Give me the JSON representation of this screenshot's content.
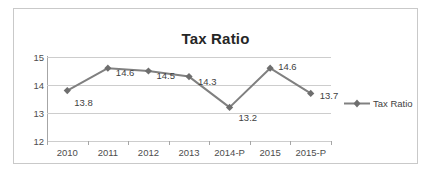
{
  "frame": {
    "border_color": "#c9c9c9",
    "background": "#ffffff"
  },
  "chart_data": {
    "type": "line",
    "title": "Tax Ratio",
    "xlabel": "",
    "ylabel": "",
    "categories": [
      "2010",
      "2011",
      "2012",
      "2013",
      "2014-P",
      "2015",
      "2015-P"
    ],
    "values": [
      13.8,
      14.6,
      14.5,
      14.3,
      13.2,
      14.6,
      13.7
    ],
    "data_labels": [
      "13.8",
      "14.6",
      "14.5",
      "14.3",
      "13.2",
      "14.6",
      "13.7"
    ],
    "series": [
      {
        "name": "Tax Ratio",
        "values": [
          13.8,
          14.6,
          14.5,
          14.3,
          13.2,
          14.6,
          13.7
        ]
      }
    ],
    "ylim": [
      12,
      15
    ],
    "yticks": [
      12,
      13,
      14,
      15
    ],
    "ytick_labels": [
      "12",
      "13",
      "14",
      "15"
    ],
    "grid": true,
    "grid_axis": "y",
    "legend": {
      "position": "right",
      "entries": [
        "Tax Ratio"
      ]
    },
    "marker": "diamond",
    "series_color": "#808080",
    "grid_color": "#cdcdcd",
    "axis_color": "#a6a6a6",
    "text_color": "#4d4d4d"
  }
}
